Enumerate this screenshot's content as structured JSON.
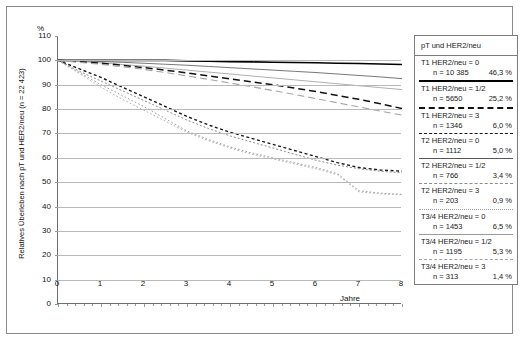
{
  "axes": {
    "unit_label": "%",
    "ylabel": "Relatives Überleben nach pT und HER2/neu (n = 22 423)",
    "xlabel": "Jahre",
    "yticks": [
      "110",
      "100",
      "90",
      "80",
      "70",
      "60",
      "50",
      "40",
      "30",
      "20",
      "10",
      "0"
    ],
    "xticks": [
      "0",
      "1",
      "2",
      "3",
      "4",
      "5",
      "6",
      "7",
      "8"
    ]
  },
  "legend": {
    "title": "pT und HER2/neu",
    "entries": [
      {
        "name": "T1 HER2/neu = 0",
        "n": "n = 10 385",
        "pct": "46,3 %",
        "style": "solid-thick"
      },
      {
        "name": "T1 HER2/neu = 1/2",
        "n": "n = 5650",
        "pct": "25,2 %",
        "style": "dash-long"
      },
      {
        "name": "T1 HER2/neu = 3",
        "n": "n = 1346",
        "pct": "6,0 %",
        "style": "dash-medium"
      },
      {
        "name": "T2 HER2/neu = 0",
        "n": "n = 1112",
        "pct": "5,0 %",
        "style": "solid-thin"
      },
      {
        "name": "T2 HER2/neu = 1/2",
        "n": "n = 766",
        "pct": "3,4 %",
        "style": "dash-fine"
      },
      {
        "name": "T2 HER2/neu = 3",
        "n": "n = 203",
        "pct": "0,9 %",
        "style": "dot-fine"
      },
      {
        "name": "T3/4 HER2/neu = 0",
        "n": "n = 1453",
        "pct": "6,5 %",
        "style": "solid-gray"
      },
      {
        "name": "T3/4 HER2/neu = 1/2",
        "n": "n = 1195",
        "pct": "5,3 %",
        "style": "dash-gray"
      },
      {
        "name": "T3/4 HER2/neu = 3",
        "n": "n = 313",
        "pct": "1,4 %",
        "style": "dot-gray"
      }
    ]
  },
  "chart_data": {
    "type": "line",
    "title": "",
    "xlabel": "Jahre",
    "ylabel": "Relatives Überleben nach pT und HER2/neu (n = 22 423)",
    "xlim": [
      0,
      8
    ],
    "ylim": [
      0,
      110
    ],
    "grid": true,
    "legend_position": "right",
    "x": [
      0,
      0.5,
      1,
      1.5,
      2,
      2.5,
      3,
      3.5,
      4,
      4.5,
      5,
      5.5,
      6,
      6.5,
      7,
      7.5,
      8
    ],
    "series": [
      {
        "name": "T1 HER2/neu = 0",
        "n": 10385,
        "share_pct": 46.3,
        "style": "solid-thick",
        "color": "#000000",
        "values": [
          100,
          100,
          100,
          100,
          100,
          100,
          99.8,
          99.7,
          99.5,
          99.4,
          99.2,
          99.1,
          99.0,
          98.8,
          98.7,
          98.5,
          98.3
        ]
      },
      {
        "name": "T2 HER2/neu = 0",
        "n": 1112,
        "share_pct": 5.0,
        "style": "solid-thin",
        "color": "#555555",
        "values": [
          100,
          99.8,
          99.5,
          99.2,
          98.8,
          98.4,
          98.0,
          97.5,
          97.0,
          96.5,
          96.0,
          95.5,
          95.0,
          94.4,
          93.8,
          93.2,
          92.5
        ]
      },
      {
        "name": "T3/4 HER2/neu = 0",
        "n": 1453,
        "share_pct": 6.5,
        "style": "solid-gray",
        "color": "#9a9a9a",
        "values": [
          100,
          99.5,
          99.0,
          98.3,
          97.6,
          96.8,
          96.0,
          95.2,
          94.4,
          93.6,
          92.8,
          92.0,
          91.2,
          90.4,
          89.6,
          88.8,
          88.0
        ]
      },
      {
        "name": "T1 HER2/neu = 1/2",
        "n": 5650,
        "share_pct": 25.2,
        "style": "dash-long",
        "color": "#111111",
        "values": [
          100,
          99.4,
          98.8,
          98.0,
          97.0,
          96.0,
          94.8,
          93.6,
          92.4,
          91.2,
          90.0,
          88.6,
          87.2,
          85.6,
          84.0,
          82.2,
          80.2
        ]
      },
      {
        "name": "T3/4 HER2/neu = 1/2",
        "n": 1195,
        "share_pct": 5.3,
        "style": "dash-gray",
        "color": "#a5a5a5",
        "values": [
          100,
          99.2,
          98.4,
          97.4,
          96.3,
          95.0,
          93.6,
          92.2,
          90.7,
          89.2,
          87.6,
          86.0,
          84.3,
          82.6,
          80.9,
          79.2,
          77.5
        ]
      },
      {
        "name": "T1 HER2/neu = 3",
        "n": 1346,
        "share_pct": 6.0,
        "style": "dash-medium",
        "color": "#1a1a1a",
        "values": [
          100,
          96.5,
          93.0,
          89.0,
          85.0,
          81.0,
          77.0,
          73.5,
          70.5,
          68.0,
          65.5,
          63.0,
          60.5,
          58.0,
          56.0,
          55.0,
          54.5
        ]
      },
      {
        "name": "T2 HER2/neu = 1/2",
        "n": 766,
        "share_pct": 3.4,
        "style": "dash-fine",
        "color": "#8c8c8c",
        "values": [
          100,
          95.5,
          91.5,
          87.5,
          83.5,
          79.5,
          75.5,
          72.0,
          69.0,
          66.5,
          64.0,
          61.5,
          59.0,
          57.0,
          55.5,
          54.5,
          53.8
        ]
      },
      {
        "name": "T2 HER2/neu = 3",
        "n": 203,
        "share_pct": 0.9,
        "style": "dot-fine",
        "color": "#9e9e9e",
        "values": [
          100,
          95.0,
          90.0,
          85.5,
          81.0,
          76.0,
          71.0,
          67.5,
          64.5,
          62.0,
          60.0,
          58.0,
          56.0,
          53.5,
          46.5,
          45.5,
          45.0
        ]
      },
      {
        "name": "T3/4 HER2/neu = 3",
        "n": 313,
        "share_pct": 1.4,
        "style": "dot-gray",
        "color": "#b0b0b0",
        "values": [
          100,
          94.5,
          89.0,
          84.0,
          79.5,
          75.0,
          70.5,
          67.0,
          64.0,
          61.5,
          59.5,
          57.5,
          55.5,
          53.0,
          46.0,
          45.2,
          44.8
        ]
      }
    ]
  }
}
